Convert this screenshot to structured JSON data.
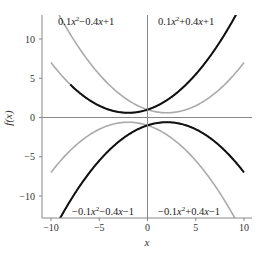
{
  "chart_data": {
    "type": "line",
    "title": "",
    "xlabel": "x",
    "ylabel": "f(x)",
    "xlim": [
      -11,
      11
    ],
    "ylim": [
      -13,
      13.2
    ],
    "xticks": [
      -10,
      -5,
      0,
      5,
      10
    ],
    "yticks": [
      -10,
      -5,
      0,
      5,
      10
    ],
    "grid": false,
    "legend": null,
    "reference_lines": {
      "horizontal_y": 0,
      "vertical_x": 0
    },
    "series": [
      {
        "name": "0.1x^2-0.4x+1",
        "formula": {
          "a": 0.1,
          "b": -0.4,
          "c": 1
        },
        "color": "#aaaaaa",
        "x_range": [
          -10,
          10
        ]
      },
      {
        "name": "0.1x^2+0.4x+1",
        "formula": {
          "a": 0.1,
          "b": 0.4,
          "c": 1
        },
        "color": "#aaaaaa",
        "x_range": [
          -10,
          10
        ]
      },
      {
        "name": "-0.1x^2-0.4x-1",
        "formula": {
          "a": -0.1,
          "b": -0.4,
          "c": -1
        },
        "color": "#aaaaaa",
        "x_range": [
          -10,
          10
        ]
      },
      {
        "name": "-0.1x^2+0.4x-1",
        "formula": {
          "a": -0.1,
          "b": 0.4,
          "c": -1
        },
        "color": "#aaaaaa",
        "x_range": [
          -10,
          10
        ]
      },
      {
        "name": "0.1x^2+0.4x+1 (bold)",
        "formula": {
          "a": 0.1,
          "b": 0.4,
          "c": 1
        },
        "color": "#111111",
        "x_range": [
          -8,
          9.2
        ]
      },
      {
        "name": "-0.1x^2+0.4x-1 (bold)",
        "formula": {
          "a": -0.1,
          "b": 0.4,
          "c": -1
        },
        "color": "#111111",
        "x_range": [
          -9.2,
          10
        ]
      }
    ],
    "annotations": [
      {
        "text": "0.1x²−0.4x+1",
        "quadrant": "top-left"
      },
      {
        "text": "0.1x²+0.4x+1",
        "quadrant": "top-right"
      },
      {
        "text": "−0.1x²−0.4x−1",
        "quadrant": "bottom-left"
      },
      {
        "text": "−0.1x²+0.4x−1",
        "quadrant": "bottom-right"
      }
    ]
  },
  "labels": {
    "xlabel": "x",
    "ylabel": "f(x)",
    "annot_tl": {
      "coef": "0.1",
      "var": "x",
      "sup": "2",
      "rest": "−0.4",
      "var2": "x",
      "tail": "+1"
    },
    "annot_tr": {
      "coef": "0.1",
      "var": "x",
      "sup": "2",
      "rest": "+0.4",
      "var2": "x",
      "tail": "+1"
    },
    "annot_bl": {
      "coef": "−0.1",
      "var": "x",
      "sup": "2",
      "rest": "−0.4",
      "var2": "x",
      "tail": "−1"
    },
    "annot_br": {
      "coef": "−0.1",
      "var": "x",
      "sup": "2",
      "rest": "+0.4",
      "var2": "x",
      "tail": "−1"
    }
  }
}
